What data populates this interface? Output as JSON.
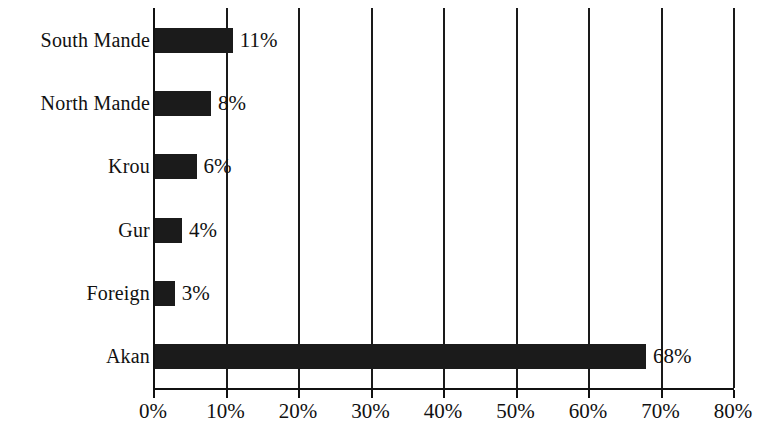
{
  "chart_data": {
    "type": "bar",
    "orientation": "horizontal",
    "title": "",
    "subtitle": "",
    "xlabel": "",
    "ylabel": "",
    "categories": [
      "Akan",
      "Foreign",
      "Gur",
      "Krou",
      "North Mande",
      "South Mande"
    ],
    "values": [
      68,
      3,
      4,
      6,
      8,
      11
    ],
    "value_labels": [
      "68%",
      "3%",
      "4%",
      "6%",
      "8%",
      "11%"
    ],
    "xlim": [
      0,
      80
    ],
    "xticks": [
      0,
      10,
      20,
      30,
      40,
      50,
      60,
      70,
      80
    ],
    "xtick_labels": [
      "0%",
      "10%",
      "20%",
      "30%",
      "40%",
      "50%",
      "60%",
      "70%",
      "80%"
    ],
    "grid": true,
    "grid_axis": "x",
    "legend": "none",
    "bar_color": "#1b1b1b",
    "axis_color": "#111111",
    "background_color": "#ffffff",
    "bars": [
      {
        "category": "South Mande",
        "value": 11,
        "label": "11%",
        "row": 0
      },
      {
        "category": "North Mande",
        "value": 8,
        "label": "8%",
        "row": 1
      },
      {
        "category": "Krou",
        "value": 6,
        "label": "6%",
        "row": 2
      },
      {
        "category": "Gur",
        "value": 4,
        "label": "4%",
        "row": 3
      },
      {
        "category": "Foreign",
        "value": 3,
        "label": "3%",
        "row": 4
      },
      {
        "category": "Akan",
        "value": 68,
        "label": "68%",
        "row": 5
      }
    ]
  }
}
